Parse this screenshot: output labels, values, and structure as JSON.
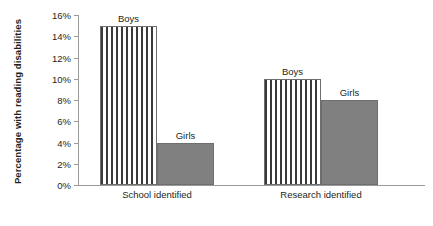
{
  "chart_data": {
    "type": "bar",
    "title": "",
    "xlabel": "",
    "ylabel": "Percentage with reading disabilities",
    "categories": [
      "School identified",
      "Research identified"
    ],
    "series": [
      {
        "name": "Boys",
        "values": [
          15,
          10
        ],
        "fill": "striped",
        "color": "#3a3a3a"
      },
      {
        "name": "Girls",
        "values": [
          4,
          8
        ],
        "fill": "solid",
        "color": "#808080"
      }
    ],
    "ylim": [
      0,
      16
    ],
    "ytick_step": 2,
    "ytick_labels": [
      "0%",
      "2%",
      "4%",
      "6%",
      "8%",
      "10%",
      "12%",
      "14%",
      "16%"
    ],
    "ytick_values": [
      0,
      2,
      4,
      6,
      8,
      10,
      12,
      14,
      16
    ],
    "grid": false,
    "legend": "none",
    "bar_labels": [
      {
        "text": "Boys",
        "value": 15,
        "category": "School identified"
      },
      {
        "text": "Girls",
        "value": 4,
        "category": "School identified"
      },
      {
        "text": "Boys",
        "value": 10,
        "category": "Research identified"
      },
      {
        "text": "Girls",
        "value": 8,
        "category": "Research identified"
      }
    ],
    "colors": {
      "axis": "#9a9a9a",
      "text": "#231f20",
      "girls_fill": "#808080",
      "boys_hatch": "#3a3a3a",
      "bar_border": "#6e6e6e",
      "background": "#ffffff"
    }
  }
}
